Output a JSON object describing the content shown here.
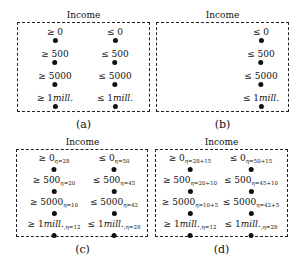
{
  "panels": [
    {
      "id": "a",
      "title": "Income",
      "caption": "(a)",
      "box": {
        "x": 17,
        "y": 22,
        "w": 133,
        "h": 90
      },
      "columns": [
        {
          "x": 37,
          "items": [
            {
              "op": "≥",
              "value": "0",
              "italic": false,
              "sub": ""
            },
            {
              "op": "≥",
              "value": "500",
              "italic": false,
              "sub": ""
            },
            {
              "op": "≥",
              "value": "5000",
              "italic": false,
              "sub": ""
            },
            {
              "op": "≥",
              "value": "1mill.",
              "italic": true,
              "sub": ""
            }
          ]
        },
        {
          "x": 97,
          "items": [
            {
              "op": "≤",
              "value": "0",
              "italic": false,
              "sub": ""
            },
            {
              "op": "≤",
              "value": "500",
              "italic": false,
              "sub": ""
            },
            {
              "op": "≤",
              "value": "5000",
              "italic": false,
              "sub": ""
            },
            {
              "op": "≤",
              "value": "1mill.",
              "italic": true,
              "sub": ""
            }
          ]
        }
      ]
    },
    {
      "id": "b",
      "title": "Income",
      "caption": "(b)",
      "box": {
        "x": 156,
        "y": 22,
        "w": 133,
        "h": 90
      },
      "columns": [
        {
          "x": 104,
          "items": [
            {
              "op": "≤",
              "value": "0",
              "italic": false,
              "sub": ""
            },
            {
              "op": "≤",
              "value": "500",
              "italic": false,
              "sub": ""
            },
            {
              "op": "≤",
              "value": "5000",
              "italic": false,
              "sub": ""
            },
            {
              "op": "≤",
              "value": "1mill.",
              "italic": true,
              "sub": ""
            }
          ]
        }
      ]
    },
    {
      "id": "c",
      "title": "Income",
      "caption": "(c)",
      "box": {
        "x": 16,
        "y": 149,
        "w": 132,
        "h": 88
      },
      "columns": [
        {
          "x": 37,
          "items": [
            {
              "op": "≥",
              "value": "0",
              "italic": false,
              "sub": "η=28"
            },
            {
              "op": "≥",
              "value": "500",
              "italic": false,
              "sub": "η=20"
            },
            {
              "op": "≥",
              "value": "5000",
              "italic": false,
              "sub": "η=10"
            },
            {
              "op": "≥",
              "value": "1mill.",
              "italic": true,
              "sub": ",η=12"
            }
          ]
        },
        {
          "x": 97,
          "items": [
            {
              "op": "≤",
              "value": "0",
              "italic": false,
              "sub": "η=50"
            },
            {
              "op": "≤",
              "value": "500",
              "italic": false,
              "sub": "η=45"
            },
            {
              "op": "≤",
              "value": "5000",
              "italic": false,
              "sub": "η=42"
            },
            {
              "op": "≤",
              "value": "1mill.",
              "italic": true,
              "sub": ",η=28"
            }
          ]
        }
      ]
    },
    {
      "id": "d",
      "title": "Income",
      "caption": "(d)",
      "box": {
        "x": 155,
        "y": 149,
        "w": 133,
        "h": 88
      },
      "columns": [
        {
          "x": 34,
          "items": [
            {
              "op": "≥",
              "value": "0",
              "italic": false,
              "sub": "η=28+15"
            },
            {
              "op": "≥",
              "value": "500",
              "italic": false,
              "sub": "η=20+10"
            },
            {
              "op": "≥",
              "value": "5000",
              "italic": false,
              "sub": "η=10+5"
            },
            {
              "op": "≥",
              "value": "1mill.",
              "italic": true,
              "sub": ",η=12"
            }
          ]
        },
        {
          "x": 95,
          "items": [
            {
              "op": "≤",
              "value": "0",
              "italic": false,
              "sub": "η=50+15"
            },
            {
              "op": "≤",
              "value": "500",
              "italic": false,
              "sub": "η=45+10"
            },
            {
              "op": "≤",
              "value": "5000",
              "italic": false,
              "sub": "η=42+5"
            },
            {
              "op": "≤",
              "value": "1mill.",
              "italic": true,
              "sub": ",η=28"
            }
          ]
        }
      ]
    }
  ]
}
